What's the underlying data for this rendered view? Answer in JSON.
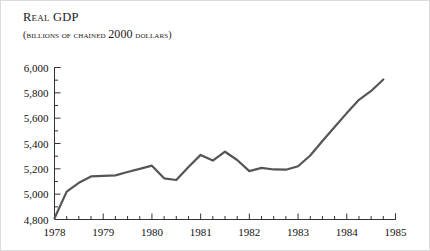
{
  "title": {
    "lead": "R",
    "rest": "eal",
    "tail": " GDP"
  },
  "subtitle": {
    "pre": "(billions of chained ",
    "num": "2000",
    "post": " dollars)"
  },
  "chart_data": {
    "type": "line",
    "title": "Real GDP",
    "subtitle": "(BILLIONS OF CHAINED 2000 DOLLARS)",
    "xlabel": "",
    "ylabel": "",
    "xlim": [
      1978,
      1985
    ],
    "ylim": [
      4800,
      6000
    ],
    "ytick_labels": [
      "4,800",
      "5,000",
      "5,200",
      "5,400",
      "5,600",
      "5,800",
      "6,000"
    ],
    "ytick_values": [
      4800,
      5000,
      5200,
      5400,
      5600,
      5800,
      6000
    ],
    "yminor_values": [
      4900,
      5100,
      5300,
      5500,
      5700,
      5900
    ],
    "xtick_labels": [
      "1978",
      "1979",
      "1980",
      "1981",
      "1982",
      "1983",
      "1984",
      "1985"
    ],
    "xtick_values": [
      1978,
      1979,
      1980,
      1981,
      1982,
      1983,
      1984,
      1985
    ],
    "xminor_per_major": 3,
    "grid": false,
    "legend": false,
    "line_color": "#555555",
    "line_width": 2.2,
    "axis_color": "#333333",
    "x": [
      1978.0,
      1978.25,
      1978.5,
      1978.75,
      1979.0,
      1979.25,
      1979.5,
      1979.75,
      1980.0,
      1980.25,
      1980.5,
      1980.75,
      1981.0,
      1981.25,
      1981.5,
      1981.75,
      1982.0,
      1982.25,
      1982.5,
      1982.75,
      1983.0,
      1983.25,
      1983.5,
      1983.75,
      1984.0,
      1984.25,
      1984.5,
      1984.75
    ],
    "values": [
      4810,
      5020,
      5090,
      5140,
      5145,
      5148,
      5175,
      5200,
      5225,
      5125,
      5112,
      5215,
      5310,
      5265,
      5335,
      5270,
      5182,
      5208,
      5195,
      5193,
      5220,
      5305,
      5420,
      5530,
      5640,
      5745,
      5815,
      5905
    ]
  }
}
